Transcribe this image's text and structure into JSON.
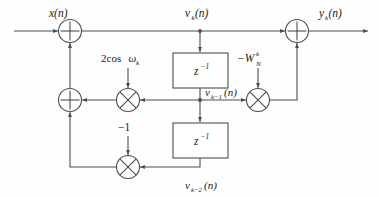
{
  "diagram": {
    "name": "goertzel-algorithm-signal-flow-graph",
    "type": "signal-flow-graph",
    "colors": {
      "line": "#4d4d4d",
      "text": "#1a1a1a",
      "background": "#fefefe",
      "node_fill": "#ffffff"
    },
    "labels": {
      "input": "x(n)",
      "output": "y",
      "output_sub": "k",
      "output_tail": "(n)",
      "v_k": "v",
      "v_k_sub": "k",
      "v_k_tail": "(n)",
      "v_k1": "v",
      "v_k1_sub": "k−1",
      "v_k1_tail": "(n)",
      "v_k2": "v",
      "v_k2_sub": "k−2",
      "v_k2_tail": "(n)",
      "coef_cos": "2cos",
      "coef_cos_omega": "ω",
      "coef_cos_sub": "k",
      "coef_w": "−W",
      "coef_w_sub": "N",
      "coef_w_sup": "k",
      "coef_neg_one": "−1",
      "delay1": "z",
      "delay1_sup": "−1",
      "delay2": "z",
      "delay2_sup": "−1"
    },
    "nodes": [
      {
        "id": "adder-input",
        "kind": "adder",
        "glyph": "plus",
        "cx": 70,
        "cy": 31
      },
      {
        "id": "adder-output",
        "kind": "adder",
        "glyph": "plus",
        "cx": 297,
        "cy": 31
      },
      {
        "id": "adder-feedback",
        "kind": "adder",
        "glyph": "plus",
        "cx": 70,
        "cy": 100
      },
      {
        "id": "mult-2cos",
        "kind": "multiplier",
        "glyph": "cross",
        "cx": 128,
        "cy": 100
      },
      {
        "id": "mult-wnk",
        "kind": "multiplier",
        "glyph": "cross",
        "cx": 258,
        "cy": 100
      },
      {
        "id": "mult-neg-one",
        "kind": "multiplier",
        "glyph": "cross",
        "cx": 128,
        "cy": 167
      }
    ],
    "blocks": [
      {
        "id": "delay-1",
        "x": 173,
        "y": 53,
        "w": 55,
        "h": 35
      },
      {
        "id": "delay-2",
        "x": 173,
        "y": 123,
        "w": 55,
        "h": 35
      }
    ],
    "junctions": [
      {
        "id": "tap-v-k",
        "cx": 200,
        "cy": 31
      },
      {
        "id": "tap-v-k-1",
        "cx": 200,
        "cy": 100
      }
    ]
  }
}
